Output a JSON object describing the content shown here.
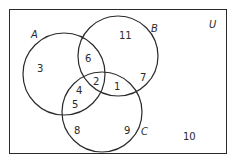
{
  "diagram": {
    "type": "venn",
    "universe_label": "U",
    "sets": [
      {
        "name": "A",
        "cx": 64,
        "cy": 74,
        "r": 41,
        "label_x": 31,
        "label_y": 38
      },
      {
        "name": "B",
        "cx": 118,
        "cy": 56,
        "r": 40,
        "label_x": 151,
        "label_y": 32
      },
      {
        "name": "C",
        "cx": 102,
        "cy": 112,
        "r": 40,
        "label_x": 141,
        "label_y": 135
      }
    ],
    "regions": [
      {
        "id": "A_only",
        "value": "3",
        "x": 40,
        "y": 72
      },
      {
        "id": "B_only",
        "value": "11",
        "x": 122,
        "y": 40
      },
      {
        "id": "C_only_left",
        "value": "8",
        "x": 76,
        "y": 135
      },
      {
        "id": "C_only_right",
        "value": "9",
        "x": 126,
        "y": 135
      },
      {
        "id": "A_and_B_only",
        "value": "6",
        "x": 88,
        "y": 60
      },
      {
        "id": "A_and_C_only_top",
        "value": "4",
        "x": 79,
        "y": 93
      },
      {
        "id": "A_and_C_only_bottom",
        "value": "5",
        "x": 74,
        "y": 107
      },
      {
        "id": "A_B_C",
        "value": "2",
        "x": 96,
        "y": 85
      },
      {
        "id": "B_and_C_only",
        "value": "1",
        "x": 117,
        "y": 90
      },
      {
        "id": "B_only_right",
        "value": "7",
        "x": 143,
        "y": 80
      },
      {
        "id": "outside",
        "value": "10",
        "x": 189,
        "y": 141
      }
    ],
    "colors": {
      "stroke": "#2a2a2a",
      "background": "#ffffff"
    }
  }
}
